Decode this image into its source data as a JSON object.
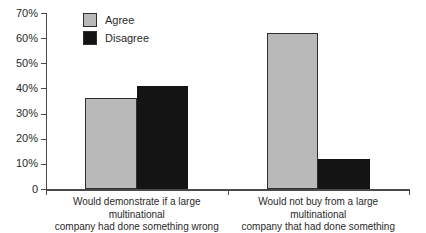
{
  "figure": {
    "background": "#ffffff",
    "axis_color": "#4a4a4a",
    "text_color": "#2a2a2a"
  },
  "chart_data": {
    "type": "bar",
    "title": "",
    "xlabel": "",
    "ylabel": "",
    "ylim": [
      0,
      70
    ],
    "grid": false,
    "legend_position": "top-left-inside",
    "ytick_labels": [
      "0",
      "10%",
      "20%",
      "30%",
      "40%",
      "50%",
      "60%",
      "70%"
    ],
    "categories": [
      [
        "Would demonstrate if a large multinational",
        "company had done something wrong"
      ],
      [
        "Would not buy from a large multinational",
        "company that had done something wrong"
      ]
    ],
    "categories_full": [
      "Would demonstrate if a large multinational company had done something wrong",
      "Would not buy from a large multinational company that had done something wrong"
    ],
    "series": [
      {
        "name": "Agree",
        "color": "#b9b9b9",
        "border_color": "#2e2e2e",
        "values": [
          36,
          62
        ]
      },
      {
        "name": "Disagree",
        "color": "#141414",
        "border_color": "#141414",
        "values": [
          41,
          12
        ]
      }
    ]
  }
}
